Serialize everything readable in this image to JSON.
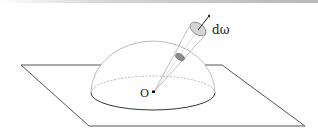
{
  "figure": {
    "labels": {
      "origin": "O",
      "solid_angle": "dω"
    },
    "colors": {
      "stroke": "#444444",
      "disc_fill": "#cfcfcf",
      "inner_disc_fill": "#8a8a8a"
    }
  }
}
